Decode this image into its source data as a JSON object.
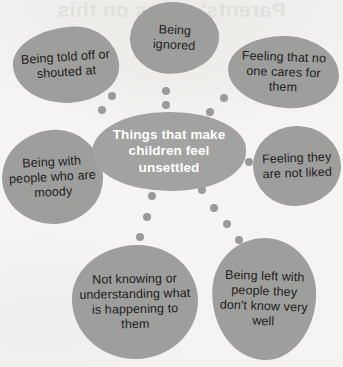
{
  "diagram": {
    "title": "Things that make children feel unsettled",
    "type": "spider-mind-map",
    "bleed_through_text": "Parents' views on this",
    "colors": {
      "background": "#f3f2f0",
      "bubble_fill": "#9e9e9c",
      "hub_fill": "#a2a2a0",
      "hub_text": "#ffffff",
      "bubble_text": "#1d1d1d",
      "connector_dot": "#9a9a98"
    },
    "hub": {
      "label": "Things that make children feel unsettled"
    },
    "bubbles": [
      {
        "id": "told-off",
        "label": "Being told off or shouted at"
      },
      {
        "id": "ignored",
        "label": "Being ignored"
      },
      {
        "id": "no-one-cares",
        "label": "Feeling that no one cares for them"
      },
      {
        "id": "not-liked",
        "label": "Feeling they are not liked"
      },
      {
        "id": "left-with-strangers",
        "label": "Being left with people they don't know very well"
      },
      {
        "id": "not-knowing",
        "label": "Not knowing or understanding what is happening to them"
      },
      {
        "id": "moody-people",
        "label": "Being with people who are moody"
      }
    ],
    "connector_dots": [
      {
        "x": 112,
        "y": 96,
        "size": 8
      },
      {
        "x": 102,
        "y": 110,
        "size": 8
      },
      {
        "x": 166,
        "y": 91,
        "size": 8
      },
      {
        "x": 166,
        "y": 105,
        "size": 8
      },
      {
        "x": 224,
        "y": 98,
        "size": 8
      },
      {
        "x": 210,
        "y": 112,
        "size": 8
      },
      {
        "x": 95,
        "y": 170,
        "size": 8
      },
      {
        "x": 230,
        "y": 160,
        "size": 8
      },
      {
        "x": 249,
        "y": 162,
        "size": 8
      },
      {
        "x": 152,
        "y": 196,
        "size": 8
      },
      {
        "x": 147,
        "y": 217,
        "size": 8
      },
      {
        "x": 140,
        "y": 237,
        "size": 8
      },
      {
        "x": 202,
        "y": 190,
        "size": 8
      },
      {
        "x": 214,
        "y": 208,
        "size": 8
      },
      {
        "x": 227,
        "y": 224,
        "size": 8
      },
      {
        "x": 239,
        "y": 240,
        "size": 8
      }
    ]
  }
}
